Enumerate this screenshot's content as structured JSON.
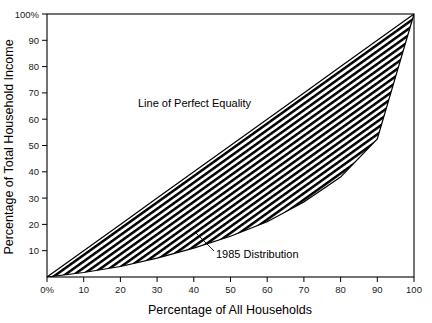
{
  "chart_data": {
    "type": "area",
    "title": "",
    "subtitle": "",
    "xlabel": "Percentage of All Households",
    "ylabel": "Percentage of Total Household Income",
    "xlim": [
      0,
      100
    ],
    "ylim": [
      0,
      100
    ],
    "grid": false,
    "legend_position": "none",
    "x_tick_labels": [
      "0%",
      "10",
      "20",
      "30",
      "40",
      "50",
      "60",
      "70",
      "80",
      "90",
      "100"
    ],
    "x_tick_values": [
      0,
      10,
      20,
      30,
      40,
      50,
      60,
      70,
      80,
      90,
      100
    ],
    "y_tick_labels": [
      "10",
      "20",
      "30",
      "40",
      "50",
      "60",
      "70",
      "80",
      "90",
      "100%"
    ],
    "y_tick_values": [
      10,
      20,
      30,
      40,
      50,
      60,
      70,
      80,
      90,
      100
    ],
    "series": [
      {
        "name": "Line of Perfect Equality",
        "x": [
          0,
          10,
          20,
          30,
          40,
          50,
          60,
          70,
          80,
          90,
          100
        ],
        "values": [
          0,
          10,
          20,
          30,
          40,
          50,
          60,
          70,
          80,
          90,
          100
        ]
      },
      {
        "name": "1985 Distribution",
        "x": [
          0,
          10,
          20,
          30,
          40,
          50,
          60,
          70,
          80,
          90,
          100
        ],
        "values": [
          0,
          1.7,
          4.0,
          7.2,
          11.0,
          15.5,
          21.0,
          28.5,
          38.0,
          52.5,
          100.0
        ]
      }
    ],
    "annotations": [
      {
        "text": "Line of Perfect Equality",
        "x": 30,
        "y": 68
      },
      {
        "text": "1985 Distribution",
        "x": 52,
        "y": 13
      }
    ],
    "shaded_region": {
      "name": "inequality-gap-band",
      "fill": "diagonal-hatch",
      "between": [
        "Line of Perfect Equality",
        "1985 Distribution"
      ]
    },
    "colors": {
      "line": "#000000",
      "hatch": "#000000",
      "background": "#ffffff",
      "frame": "#000000"
    }
  },
  "axes": {
    "x_title": "Percentage of All Households",
    "y_title": "Percentage of Total Household Income"
  },
  "labels": {
    "equality_line": "Line of Perfect Equality",
    "distribution": "1985 Distribution"
  }
}
